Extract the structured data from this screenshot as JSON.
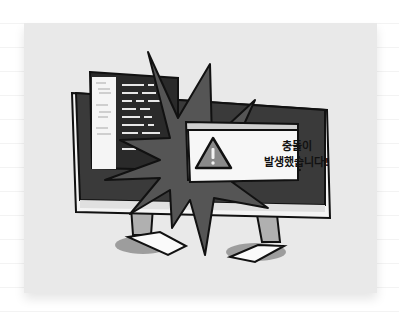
{
  "illustration": {
    "alert_message_line1": "충돌이",
    "alert_message_line2": "발생했습니다!",
    "alert_icon": "warning-triangle-icon",
    "colors": {
      "card_bg": "#e9e9e9",
      "monitor_dark": "#3a3a3a",
      "burst": "#555555",
      "outline": "#111111",
      "dialog_bg": "#f7f7f7",
      "warning_fill": "#8a8a8a"
    }
  }
}
